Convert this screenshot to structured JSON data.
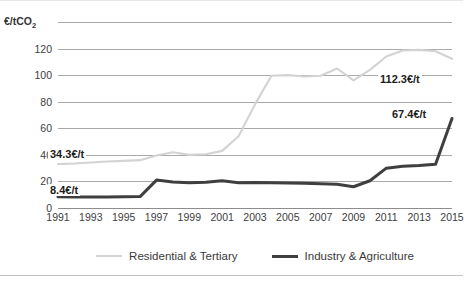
{
  "chart_data": {
    "type": "line",
    "title": "",
    "subtitle": "",
    "xlabel": "",
    "ylabel": "€/tCO₂",
    "ylabel_plain": "EUR per tCO2",
    "xlim": [
      1991,
      2015
    ],
    "ylim": [
      0,
      140
    ],
    "yticks": [
      0,
      20,
      40,
      60,
      80,
      100,
      120
    ],
    "ytick_labels": [
      "0",
      "20",
      "40",
      "60",
      "80",
      "100",
      "120"
    ],
    "grid": "horizontal",
    "legend_position": "bottom-center",
    "x": [
      1991,
      1992,
      1993,
      1994,
      1995,
      1996,
      1997,
      1998,
      1999,
      2000,
      2001,
      2002,
      2003,
      2004,
      2005,
      2006,
      2007,
      2008,
      2009,
      2010,
      2011,
      2012,
      2013,
      2014,
      2015
    ],
    "xtick_labels": [
      "1991",
      "1993",
      "1995",
      "1997",
      "1999",
      "2001",
      "2003",
      "2005",
      "2007",
      "2009",
      "2011",
      "2013",
      "2015"
    ],
    "series": [
      {
        "name": "Residential & Tertiary",
        "color": "#d3d3d3",
        "width": 2.1,
        "values": [
          33.0,
          33.5,
          34.3,
          35.0,
          35.5,
          36.0,
          39.5,
          42.0,
          40.0,
          40.5,
          43.0,
          54.0,
          78.0,
          99.5,
          100.0,
          99.0,
          99.5,
          105.0,
          96.0,
          104.0,
          114.0,
          118.5,
          119.0,
          118.0,
          112.3
        ]
      },
      {
        "name": "Industry & Agriculture",
        "color": "#3f3f3f",
        "width": 3.0,
        "values": [
          8.4,
          8.3,
          8.2,
          8.3,
          8.4,
          8.6,
          21.0,
          19.5,
          19.0,
          19.3,
          20.5,
          19.0,
          19.2,
          19.0,
          18.8,
          18.6,
          18.2,
          17.8,
          16.0,
          20.5,
          30.0,
          31.5,
          32.0,
          33.0,
          67.4
        ]
      }
    ],
    "annotations": [
      {
        "id": "res-start",
        "text": "34.3€/t",
        "series": "Residential & Tertiary",
        "year": 1993,
        "value": 34.3
      },
      {
        "id": "ind-start",
        "text": "8.4€/t",
        "series": "Industry & Agriculture",
        "year": 1991,
        "value": 8.4
      },
      {
        "id": "res-end",
        "text": "112.3€/t",
        "series": "Residential & Tertiary",
        "year": 2015,
        "value": 112.3
      },
      {
        "id": "ind-end",
        "text": "67.4€/t",
        "series": "Industry & Agriculture",
        "year": 2015,
        "value": 67.4
      }
    ]
  },
  "axis": {
    "y_title": "€/tCO",
    "y_title_sub": "2"
  },
  "legend": {
    "items": [
      {
        "label": "Residential & Tertiary",
        "swatch": "line-swatch-light"
      },
      {
        "label": "Industry & Agriculture",
        "swatch": "line-swatch-dark"
      }
    ]
  }
}
